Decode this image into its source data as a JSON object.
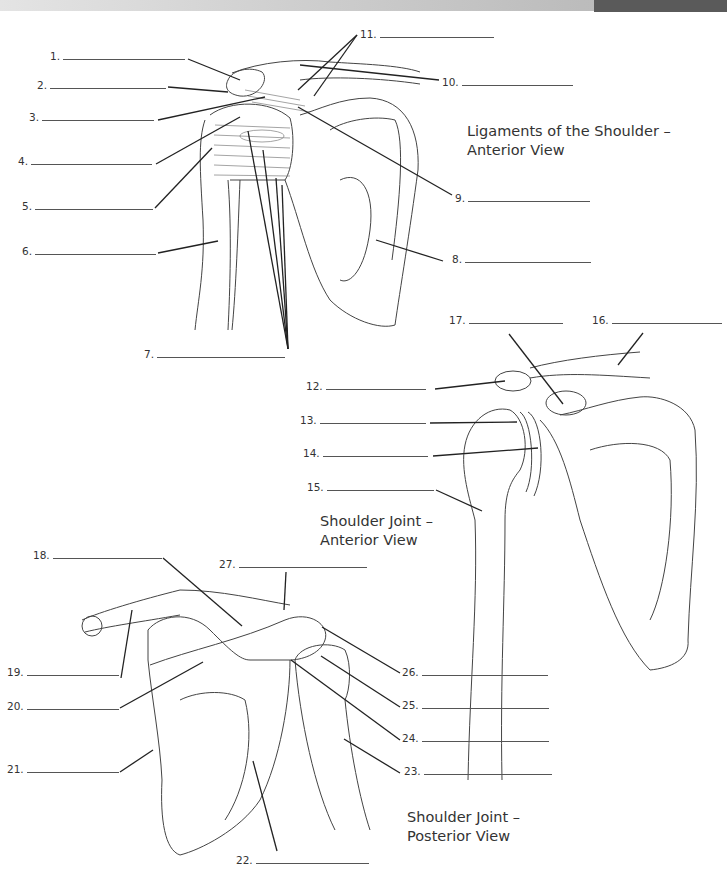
{
  "diagrams": [
    {
      "title_line1": "Ligaments of the Shoulder –",
      "title_line2": "Anterior View",
      "labels": [
        {
          "num": "1."
        },
        {
          "num": "2."
        },
        {
          "num": "3."
        },
        {
          "num": "4."
        },
        {
          "num": "5."
        },
        {
          "num": "6."
        },
        {
          "num": "7."
        },
        {
          "num": "8."
        },
        {
          "num": "9."
        },
        {
          "num": "10."
        },
        {
          "num": "11."
        }
      ]
    },
    {
      "title_line1": "Shoulder Joint –",
      "title_line2": "Anterior View",
      "labels": [
        {
          "num": "12."
        },
        {
          "num": "13."
        },
        {
          "num": "14."
        },
        {
          "num": "15."
        },
        {
          "num": "16."
        },
        {
          "num": "17."
        }
      ]
    },
    {
      "title_line1": "Shoulder Joint –",
      "title_line2": "Posterior View",
      "labels": [
        {
          "num": "18."
        },
        {
          "num": "19."
        },
        {
          "num": "20."
        },
        {
          "num": "21."
        },
        {
          "num": "22."
        },
        {
          "num": "23."
        },
        {
          "num": "24."
        },
        {
          "num": "25."
        },
        {
          "num": "26."
        },
        {
          "num": "27."
        }
      ]
    }
  ]
}
